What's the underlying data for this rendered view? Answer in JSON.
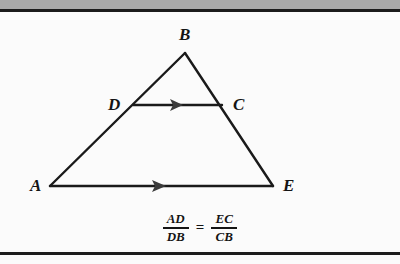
{
  "figure": {
    "kind": "geometry-diagram",
    "background_color": "#fbfbfb",
    "line_color": "#1a1a1a",
    "band_color": "#a9a9a9",
    "rule_color": "#1c1c1c"
  },
  "labels": {
    "a": "A",
    "b": "B",
    "c": "C",
    "d": "D",
    "e": "E"
  },
  "points": {
    "A": {
      "x": 50,
      "y": 174
    },
    "B": {
      "x": 185,
      "y": 41
    },
    "C": {
      "x": 222,
      "y": 93
    },
    "D": {
      "x": 133,
      "y": 93
    },
    "E": {
      "x": 273,
      "y": 174
    }
  },
  "segments": [
    {
      "name": "AB",
      "from": "A",
      "to": "B"
    },
    {
      "name": "BE",
      "from": "B",
      "to": "E"
    },
    {
      "name": "AE",
      "from": "A",
      "to": "E",
      "arrow": "single"
    },
    {
      "name": "DC",
      "from": "D",
      "to": "C",
      "arrow": "single"
    }
  ],
  "formula": {
    "left": {
      "numerator": "AD",
      "denominator": "DB"
    },
    "operator": "=",
    "right": {
      "numerator": "EC",
      "denominator": "CB"
    }
  }
}
